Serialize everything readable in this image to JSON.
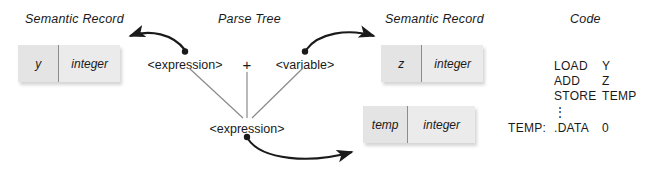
{
  "diagram": {
    "headers": [
      {
        "label": "Semantic Record"
      },
      {
        "label": "Parse Tree"
      },
      {
        "label": "Semantic Record"
      },
      {
        "label": "Code"
      }
    ],
    "records": [
      {
        "name": "y",
        "type": "integer"
      },
      {
        "name": "z",
        "type": "integer"
      },
      {
        "name": "temp",
        "type": "integer"
      }
    ],
    "parse_tree": {
      "left_node": "<expression>",
      "operator": "+",
      "right_node": "<variable>",
      "root_node": "<expression>"
    },
    "code": {
      "lines": [
        {
          "label": "",
          "op": "LOAD",
          "arg": "Y"
        },
        {
          "label": "",
          "op": "ADD",
          "arg": "Z"
        },
        {
          "label": "",
          "op": "STORE",
          "arg": "TEMP"
        },
        {
          "label": "",
          "op": "",
          "arg": ""
        },
        {
          "label": "TEMP:",
          "op": ".DATA",
          "arg": "0"
        }
      ],
      "vertical_ellipsis": "⋮"
    },
    "colors": {
      "box_fill": "#e6e6e6",
      "box_divider": "#8c8c8c",
      "ink": "#1a1a1a",
      "tree_line": "#7a7a7a",
      "background": "#ffffff"
    }
  }
}
